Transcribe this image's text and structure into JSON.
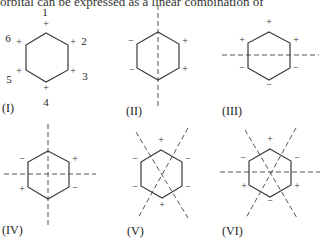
{
  "header_text": "orbital can be expressed as a linear combination of",
  "vertex_numbers": [
    "1",
    "2",
    "3",
    "4",
    "5",
    "6"
  ],
  "panels": [
    {
      "label": "(I)",
      "signs": [
        "+",
        "+",
        "+",
        "+",
        "+",
        "+"
      ],
      "nodes": "none"
    },
    {
      "label": "(II)",
      "signs": [
        "",
        "+",
        "+",
        "",
        "−",
        "−"
      ],
      "nodes": "vertical"
    },
    {
      "label": "(III)",
      "signs": [
        "+",
        "+",
        "−",
        "−",
        "−",
        "+"
      ],
      "nodes": "horizontal"
    },
    {
      "label": "(IV)",
      "signs": [
        "",
        "+",
        "−",
        "",
        "+",
        "−"
      ],
      "nodes": "vertical+horizontal"
    },
    {
      "label": "(V)",
      "signs": [
        "+",
        "−",
        "−",
        "+",
        "−",
        "−"
      ],
      "nodes": "two-diagonals"
    },
    {
      "label": "(VI)",
      "signs": [
        "+",
        "−",
        "+",
        "−",
        "+",
        "−"
      ],
      "nodes": "horizontal+two-diagonals"
    }
  ],
  "colors": {
    "line": "#3a3a3a",
    "dash": "#555555",
    "text": "#222222"
  }
}
